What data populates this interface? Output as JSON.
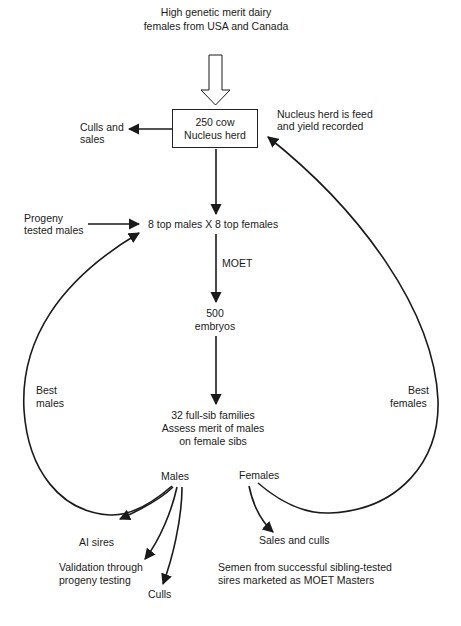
{
  "source": {
    "line1": "High genetic merit dairy",
    "line2": "females from USA and Canada"
  },
  "nucleus_box": {
    "line1": "250 cow",
    "line2": "Nucleus herd"
  },
  "culls_and_sales": {
    "line1": "Culls and",
    "line2": "sales"
  },
  "nucleus_note": {
    "line1": "Nucleus herd is feed",
    "line2": "and yield recorded"
  },
  "progeny_tested": {
    "line1": "Progeny",
    "line2": "tested males"
  },
  "mating": "8 top males X 8 top females",
  "moet_label": "MOET",
  "embryos": {
    "line1": "500",
    "line2": "embryos"
  },
  "families": {
    "line1": "32 full-sib families",
    "line2": "Assess merit of males",
    "line3": "on female sibs"
  },
  "best_males": {
    "line1": "Best",
    "line2": "males"
  },
  "best_females": {
    "line1": "Best",
    "line2": "females"
  },
  "males_label": "Males",
  "females_label": "Females",
  "male_outcomes": {
    "ai_sires": "AI sires",
    "validation_line1": "Validation through",
    "validation_line2": "progeny testing",
    "culls": "Culls"
  },
  "female_outcomes": {
    "sales_and_culls": "Sales and culls"
  },
  "footnote": {
    "line1": "Semen from successful sibling-tested",
    "line2": "sires marketed as MOET Masters"
  },
  "colors": {
    "ink": "#1a1a1a",
    "background": "#ffffff"
  }
}
